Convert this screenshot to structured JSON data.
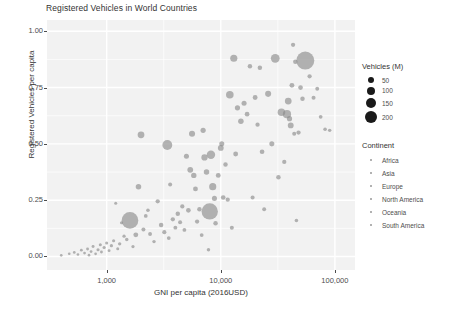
{
  "chart_data": {
    "type": "scatter",
    "title": "Registered Vehicles in World Countries",
    "xlabel": "GNI per capita (2016USD)",
    "ylabel": "Registered Vehicles per capita",
    "xscale": "log",
    "xlim": [
      300,
      150000
    ],
    "ylim": [
      -0.06,
      1.05
    ],
    "xticks": [
      1000,
      10000,
      100000
    ],
    "xtick_labels": [
      "1,000",
      "10,000",
      "100,000"
    ],
    "yticks": [
      0.0,
      0.25,
      0.5,
      0.75,
      1.0
    ],
    "ytick_labels": [
      "0.00",
      "0.25",
      "0.50",
      "0.75",
      "1.00"
    ],
    "grid": true,
    "grid_color": "#ffffff",
    "panel_background": "#f2f2f2",
    "point_color": "#8c8c8c",
    "point_opacity": 0.65,
    "legend_position": "right",
    "size_legend": {
      "title": "Vehicles (M)",
      "values": [
        50,
        100,
        150,
        200
      ],
      "labels": [
        "50",
        "100",
        "150",
        "200"
      ],
      "radii_px": [
        3.0,
        4.0,
        5.0,
        6.2
      ]
    },
    "color_legend": {
      "title": "Continent",
      "labels": [
        "Africa",
        "Asia",
        "Europe",
        "North America",
        "Oceania",
        "South America"
      ]
    },
    "size_field": "Vehicles (M)",
    "points": [
      {
        "x": 400,
        "y": 0.005,
        "s": 0.4,
        "c": "Africa"
      },
      {
        "x": 470,
        "y": 0.012,
        "s": 0.4,
        "c": "Africa"
      },
      {
        "x": 520,
        "y": 0.018,
        "s": 0.5,
        "c": "Africa"
      },
      {
        "x": 560,
        "y": 0.009,
        "s": 0.4,
        "c": "Africa"
      },
      {
        "x": 600,
        "y": 0.028,
        "s": 0.6,
        "c": "Africa"
      },
      {
        "x": 640,
        "y": 0.015,
        "s": 0.5,
        "c": "Africa"
      },
      {
        "x": 680,
        "y": 0.033,
        "s": 0.8,
        "c": "Africa"
      },
      {
        "x": 700,
        "y": 0.006,
        "s": 0.4,
        "c": "Africa"
      },
      {
        "x": 730,
        "y": 0.022,
        "s": 0.6,
        "c": "Africa"
      },
      {
        "x": 760,
        "y": 0.044,
        "s": 0.9,
        "c": "Africa"
      },
      {
        "x": 800,
        "y": 0.012,
        "s": 0.5,
        "c": "Africa"
      },
      {
        "x": 840,
        "y": 0.03,
        "s": 1.2,
        "c": "Africa"
      },
      {
        "x": 880,
        "y": 0.052,
        "s": 1.0,
        "c": "Africa"
      },
      {
        "x": 900,
        "y": 0.02,
        "s": 0.7,
        "c": "Africa"
      },
      {
        "x": 950,
        "y": 0.04,
        "s": 1.4,
        "c": "Asia"
      },
      {
        "x": 1000,
        "y": 0.06,
        "s": 1.1,
        "c": "Africa"
      },
      {
        "x": 1050,
        "y": 0.026,
        "s": 0.8,
        "c": "Africa"
      },
      {
        "x": 1100,
        "y": 0.048,
        "s": 1.5,
        "c": "Asia"
      },
      {
        "x": 1150,
        "y": 0.07,
        "s": 1.3,
        "c": "Africa"
      },
      {
        "x": 1200,
        "y": 0.236,
        "s": 1.0,
        "c": "Africa"
      },
      {
        "x": 1250,
        "y": 0.034,
        "s": 1.0,
        "c": "Asia"
      },
      {
        "x": 1300,
        "y": 0.056,
        "s": 1.8,
        "c": "Asia"
      },
      {
        "x": 1350,
        "y": 0.15,
        "s": 1.2,
        "c": "Africa"
      },
      {
        "x": 1420,
        "y": 0.09,
        "s": 1.6,
        "c": "Asia"
      },
      {
        "x": 1500,
        "y": 0.075,
        "s": 2.0,
        "c": "Asia"
      },
      {
        "x": 1600,
        "y": 0.16,
        "s": 210,
        "c": "Asia"
      },
      {
        "x": 1700,
        "y": 0.044,
        "s": 1.4,
        "c": "Africa"
      },
      {
        "x": 1800,
        "y": 0.096,
        "s": 8.0,
        "c": "Asia"
      },
      {
        "x": 1900,
        "y": 0.31,
        "s": 12.0,
        "c": "Asia"
      },
      {
        "x": 2000,
        "y": 0.54,
        "s": 22.0,
        "c": "Europe"
      },
      {
        "x": 2100,
        "y": 0.12,
        "s": 4.0,
        "c": "Asia"
      },
      {
        "x": 2200,
        "y": 0.18,
        "s": 3.0,
        "c": "Africa"
      },
      {
        "x": 2300,
        "y": 0.205,
        "s": 2.5,
        "c": "Asia"
      },
      {
        "x": 2400,
        "y": 0.1,
        "s": 3.5,
        "c": "Asia"
      },
      {
        "x": 2600,
        "y": 0.066,
        "s": 2.0,
        "c": "Asia"
      },
      {
        "x": 2800,
        "y": 0.245,
        "s": 5.0,
        "c": "Asia"
      },
      {
        "x": 3000,
        "y": 0.14,
        "s": 6.0,
        "c": "Asia"
      },
      {
        "x": 3200,
        "y": 0.108,
        "s": 4.5,
        "c": "South America"
      },
      {
        "x": 3400,
        "y": 0.495,
        "s": 60.0,
        "c": "South America"
      },
      {
        "x": 3500,
        "y": 0.082,
        "s": 3.0,
        "c": "Africa"
      },
      {
        "x": 3600,
        "y": 0.32,
        "s": 4.0,
        "c": "Asia"
      },
      {
        "x": 3800,
        "y": 0.165,
        "s": 5.0,
        "c": "South America"
      },
      {
        "x": 4000,
        "y": 0.128,
        "s": 3.5,
        "c": "Asia"
      },
      {
        "x": 4200,
        "y": 0.19,
        "s": 6.0,
        "c": "South America"
      },
      {
        "x": 4400,
        "y": 0.152,
        "s": 4.0,
        "c": "Europe"
      },
      {
        "x": 4600,
        "y": 0.222,
        "s": 5.0,
        "c": "Asia"
      },
      {
        "x": 4800,
        "y": 0.118,
        "s": 3.0,
        "c": "Africa"
      },
      {
        "x": 5000,
        "y": 0.445,
        "s": 9.0,
        "c": "Europe"
      },
      {
        "x": 5200,
        "y": 0.205,
        "s": 7.0,
        "c": "South America"
      },
      {
        "x": 5400,
        "y": 0.385,
        "s": 14.0,
        "c": "Europe"
      },
      {
        "x": 5600,
        "y": 0.545,
        "s": 16.0,
        "c": "Europe"
      },
      {
        "x": 5800,
        "y": 0.36,
        "s": 11.0,
        "c": "Europe"
      },
      {
        "x": 6000,
        "y": 0.3,
        "s": 8.0,
        "c": "South America"
      },
      {
        "x": 6200,
        "y": 0.155,
        "s": 5.0,
        "c": "Asia"
      },
      {
        "x": 6500,
        "y": 0.21,
        "s": 6.0,
        "c": "Asia"
      },
      {
        "x": 6800,
        "y": 0.095,
        "s": 3.0,
        "c": "Asia"
      },
      {
        "x": 7000,
        "y": 0.56,
        "s": 10.0,
        "c": "Europe"
      },
      {
        "x": 7200,
        "y": 0.44,
        "s": 18.0,
        "c": "South America"
      },
      {
        "x": 7500,
        "y": 0.375,
        "s": 12.0,
        "c": "Europe"
      },
      {
        "x": 7800,
        "y": 0.03,
        "s": 2.0,
        "c": "Asia"
      },
      {
        "x": 8000,
        "y": 0.2,
        "s": 200,
        "c": "Asia"
      },
      {
        "x": 8200,
        "y": 0.452,
        "s": 40.0,
        "c": "South America"
      },
      {
        "x": 8500,
        "y": 0.31,
        "s": 26.0,
        "c": "Europe"
      },
      {
        "x": 8800,
        "y": 0.258,
        "s": 9.0,
        "c": "Europe"
      },
      {
        "x": 9000,
        "y": 0.148,
        "s": 6.0,
        "c": "Asia"
      },
      {
        "x": 9500,
        "y": 0.36,
        "s": 8.0,
        "c": "Europe"
      },
      {
        "x": 10000,
        "y": 0.482,
        "s": 14.0,
        "c": "Europe"
      },
      {
        "x": 10200,
        "y": 0.5,
        "s": 9.0,
        "c": "Europe"
      },
      {
        "x": 10500,
        "y": 0.262,
        "s": 7.0,
        "c": "Asia"
      },
      {
        "x": 11000,
        "y": 0.408,
        "s": 6.0,
        "c": "Europe"
      },
      {
        "x": 11500,
        "y": 0.252,
        "s": 5.0,
        "c": "Asia"
      },
      {
        "x": 12000,
        "y": 0.718,
        "s": 30.0,
        "c": "Europe"
      },
      {
        "x": 12500,
        "y": 0.128,
        "s": 4.0,
        "c": "Africa"
      },
      {
        "x": 13000,
        "y": 0.88,
        "s": 26.0,
        "c": "Europe"
      },
      {
        "x": 13500,
        "y": 0.455,
        "s": 8.0,
        "c": "Asia"
      },
      {
        "x": 14000,
        "y": 0.66,
        "s": 10.0,
        "c": "Europe"
      },
      {
        "x": 15000,
        "y": 0.6,
        "s": 12.0,
        "c": "Europe"
      },
      {
        "x": 16000,
        "y": 0.68,
        "s": 9.0,
        "c": "Europe"
      },
      {
        "x": 17000,
        "y": 0.632,
        "s": 7.0,
        "c": "Europe"
      },
      {
        "x": 18000,
        "y": 0.845,
        "s": 6.0,
        "c": "Europe"
      },
      {
        "x": 19000,
        "y": 0.262,
        "s": 4.0,
        "c": "Asia"
      },
      {
        "x": 20000,
        "y": 0.706,
        "s": 8.0,
        "c": "Europe"
      },
      {
        "x": 21000,
        "y": 0.585,
        "s": 5.0,
        "c": "Europe"
      },
      {
        "x": 22000,
        "y": 0.838,
        "s": 6.0,
        "c": "Europe"
      },
      {
        "x": 23000,
        "y": 0.465,
        "s": 7.0,
        "c": "Asia"
      },
      {
        "x": 24000,
        "y": 0.21,
        "s": 3.5,
        "c": "Asia"
      },
      {
        "x": 26000,
        "y": 0.722,
        "s": 16.0,
        "c": "Europe"
      },
      {
        "x": 28000,
        "y": 0.5,
        "s": 9.0,
        "c": "Asia"
      },
      {
        "x": 30000,
        "y": 0.88,
        "s": 45.0,
        "c": "Europe"
      },
      {
        "x": 32000,
        "y": 0.352,
        "s": 6.0,
        "c": "Asia"
      },
      {
        "x": 34000,
        "y": 0.64,
        "s": 30.0,
        "c": "Europe"
      },
      {
        "x": 36000,
        "y": 0.42,
        "s": 5.0,
        "c": "Asia"
      },
      {
        "x": 38000,
        "y": 0.632,
        "s": 38.0,
        "c": "Asia"
      },
      {
        "x": 39000,
        "y": 0.69,
        "s": 22.0,
        "c": "Europe"
      },
      {
        "x": 40000,
        "y": 0.612,
        "s": 10.0,
        "c": "Oceania"
      },
      {
        "x": 41000,
        "y": 0.582,
        "s": 14.0,
        "c": "Europe"
      },
      {
        "x": 42000,
        "y": 0.76,
        "s": 8.0,
        "c": "Oceania"
      },
      {
        "x": 43000,
        "y": 0.94,
        "s": 5.0,
        "c": "Europe"
      },
      {
        "x": 44000,
        "y": 0.545,
        "s": 4.0,
        "c": "Asia"
      },
      {
        "x": 45000,
        "y": 0.865,
        "s": 6.0,
        "c": "Europe"
      },
      {
        "x": 46000,
        "y": 0.16,
        "s": 2.5,
        "c": "Asia"
      },
      {
        "x": 48000,
        "y": 0.55,
        "s": 5.0,
        "c": "Europe"
      },
      {
        "x": 50000,
        "y": 0.75,
        "s": 7.0,
        "c": "Europe"
      },
      {
        "x": 52000,
        "y": 0.7,
        "s": 6.0,
        "c": "Europe"
      },
      {
        "x": 55000,
        "y": 0.87,
        "s": 250,
        "c": "North America"
      },
      {
        "x": 60000,
        "y": 0.8,
        "s": 5.0,
        "c": "Europe"
      },
      {
        "x": 65000,
        "y": 0.705,
        "s": 4.0,
        "c": "Europe"
      },
      {
        "x": 70000,
        "y": 0.745,
        "s": 3.5,
        "c": "Europe"
      },
      {
        "x": 75000,
        "y": 0.62,
        "s": 3.0,
        "c": "Asia"
      },
      {
        "x": 82000,
        "y": 0.565,
        "s": 2.5,
        "c": "Europe"
      },
      {
        "x": 90000,
        "y": 0.56,
        "s": 2.0,
        "c": "Europe"
      }
    ]
  },
  "legend": {
    "size_title": "Vehicles (M)",
    "size_items": [
      "50",
      "100",
      "150",
      "200"
    ],
    "continent_title": "Continent",
    "continent_items": [
      "Africa",
      "Asia",
      "Europe",
      "North America",
      "Oceania",
      "South America"
    ]
  }
}
